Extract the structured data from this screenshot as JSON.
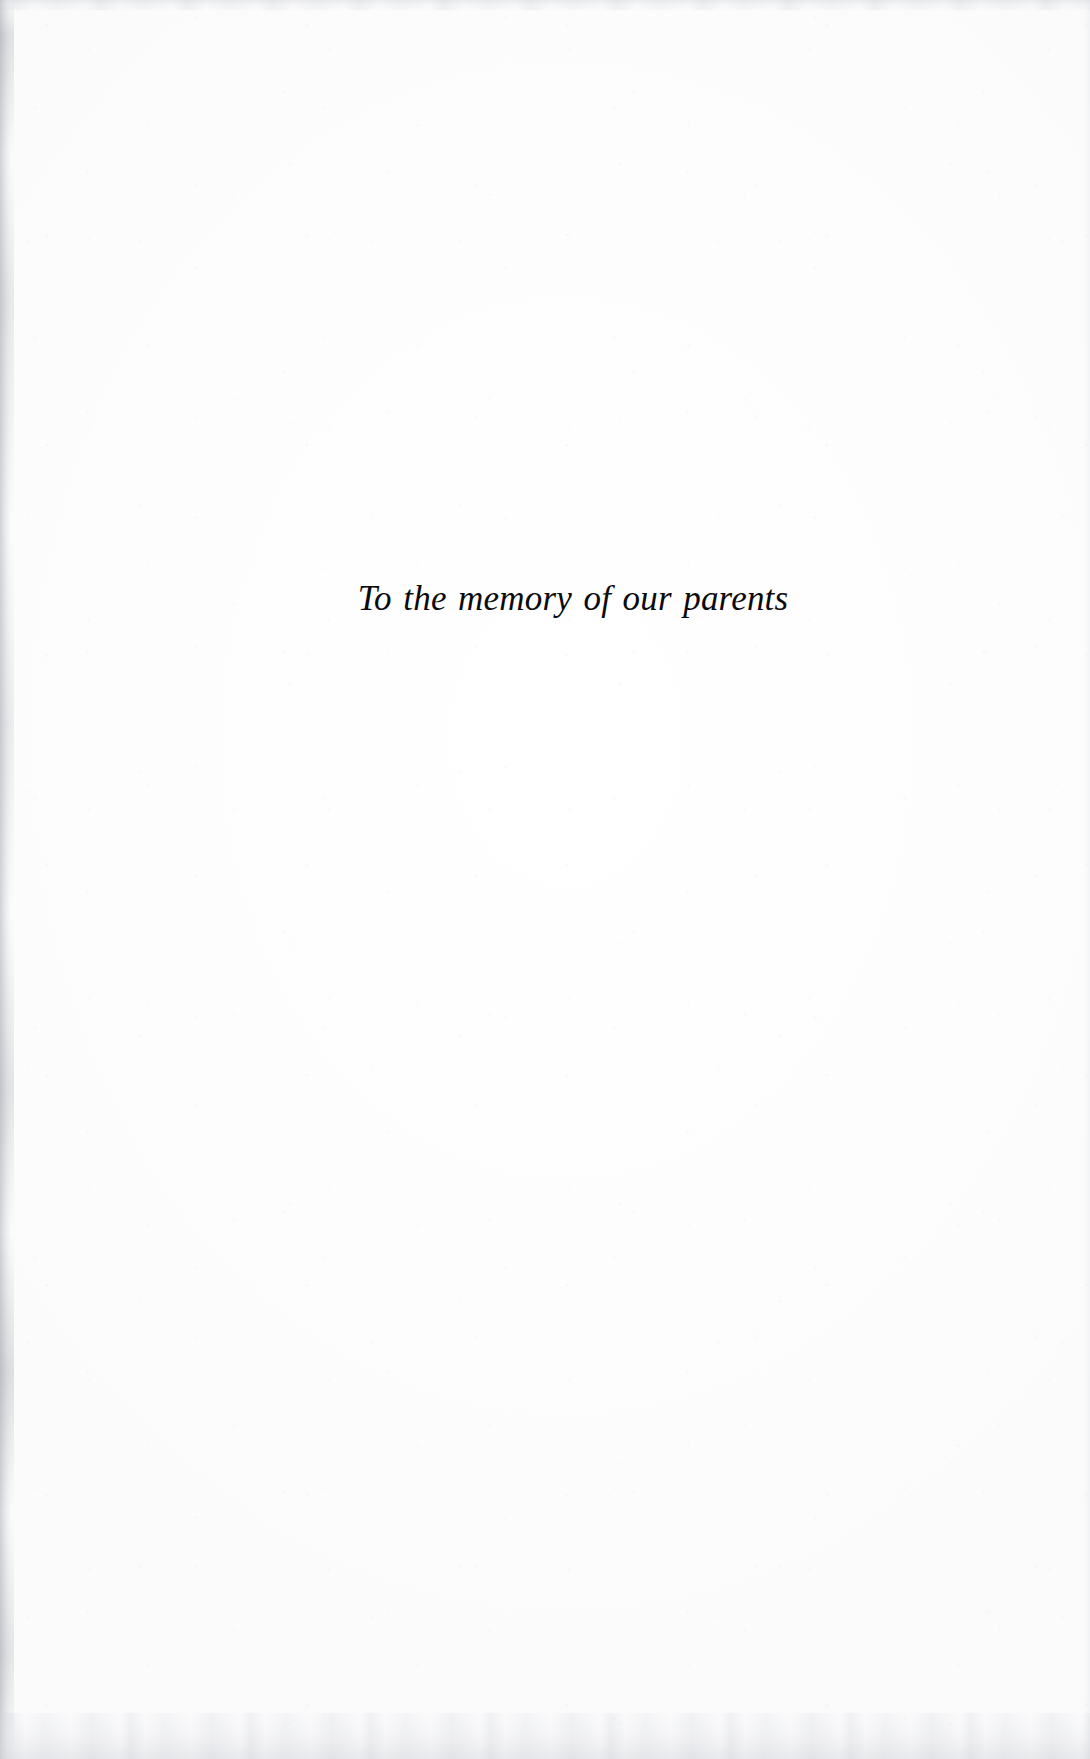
{
  "page": {
    "kind": "book-dedication-page",
    "background_color": "#fefefe",
    "text_color": "#0b0b0d",
    "width": 1090,
    "height": 1759
  },
  "dedication": {
    "text": "To the memory of our parents"
  },
  "scan_artifacts": {
    "left_edge_shadow_color": "#9699a0",
    "top_edge_smudge_color": "#c4c7cd",
    "bottom_edge_smudge_color": "#c6c9cf",
    "right_edge_shadow_color": "#d6d9de"
  }
}
